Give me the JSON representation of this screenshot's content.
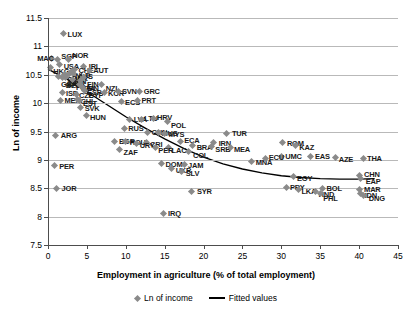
{
  "chart_data": {
    "type": "scatter",
    "title": "",
    "xlabel": "Employment in agriculture (% of total employment)",
    "ylabel": "Ln of income",
    "xlim": [
      0,
      45
    ],
    "ylim": [
      7.5,
      11.5
    ],
    "xticks": [
      0,
      5,
      10,
      15,
      20,
      25,
      30,
      35,
      40,
      45
    ],
    "yticks": [
      7.5,
      8,
      8.5,
      9,
      9.5,
      10,
      10.5,
      11,
      11.5
    ],
    "grid": true,
    "legend_position": "bottom",
    "legend": [
      {
        "label": "Ln of income",
        "marker": "diamond",
        "color": "#8a8a8a"
      },
      {
        "label": "Fitted values",
        "marker": "line",
        "color": "#000000"
      }
    ],
    "series": [
      {
        "name": "Ln of income",
        "points": [
          {
            "label": "LUX",
            "x": 2.0,
            "y": 11.22,
            "lx": 4,
            "ly": 0
          },
          {
            "label": "MAC",
            "x": 0.4,
            "y": 10.78,
            "lx": -14,
            "ly": -1
          },
          {
            "label": "SGP",
            "x": 1.2,
            "y": 10.76,
            "lx": 4,
            "ly": -4
          },
          {
            "label": "NOR",
            "x": 2.6,
            "y": 10.77,
            "lx": 4,
            "ly": -4
          },
          {
            "label": "USA",
            "x": 1.5,
            "y": 10.68,
            "lx": 4,
            "ly": 1
          },
          {
            "label": "HKG",
            "x": 0.3,
            "y": 10.62,
            "lx": 3,
            "ly": 3
          },
          {
            "label": "IRL",
            "x": 4.6,
            "y": 10.65,
            "lx": 5,
            "ly": 0
          },
          {
            "label": "CHE",
            "x": 3.4,
            "y": 10.6,
            "lx": 4,
            "ly": 1
          },
          {
            "label": "AUT",
            "x": 5.3,
            "y": 10.57,
            "lx": 4,
            "ly": -1
          },
          {
            "label": "NLD",
            "x": 3.0,
            "y": 10.55,
            "lx": 4,
            "ly": 3
          },
          {
            "label": "AUS",
            "x": 3.3,
            "y": 10.53,
            "lx": 4,
            "ly": 3
          },
          {
            "label": "DNK",
            "x": 2.7,
            "y": 10.52,
            "lx": 3,
            "ly": 4
          },
          {
            "label": "SWE",
            "x": 2.1,
            "y": 10.5,
            "lx": 3,
            "ly": 4
          },
          {
            "label": "CAN",
            "x": 2.4,
            "y": 10.48,
            "lx": 4,
            "ly": 5
          },
          {
            "label": "DEU",
            "x": 2.2,
            "y": 10.46,
            "lx": 4,
            "ly": 6
          },
          {
            "label": "BEL",
            "x": 1.9,
            "y": 10.45,
            "lx": 3,
            "ly": 7
          },
          {
            "label": "GBR",
            "x": 1.3,
            "y": 10.47,
            "lx": 3,
            "ly": 8
          },
          {
            "label": "FIN",
            "x": 4.5,
            "y": 10.45,
            "lx": 4,
            "ly": 6
          },
          {
            "label": "FRA",
            "x": 3.1,
            "y": 10.42,
            "lx": 4,
            "ly": 8
          },
          {
            "label": "JPN",
            "x": 4.2,
            "y": 10.4,
            "lx": 4,
            "ly": 8
          },
          {
            "label": "ITA",
            "x": 4.0,
            "y": 10.33,
            "lx": 5,
            "ly": 4
          },
          {
            "label": "ESP",
            "x": 4.4,
            "y": 10.28,
            "lx": 5,
            "ly": 5
          },
          {
            "label": "NZL",
            "x": 6.9,
            "y": 10.32,
            "lx": 4,
            "ly": 3
          },
          {
            "label": "CYP",
            "x": 4.7,
            "y": 10.22,
            "lx": 4,
            "ly": 4
          },
          {
            "label": "ISR",
            "x": 1.8,
            "y": 10.18,
            "lx": 4,
            "ly": 0
          },
          {
            "label": "CZE",
            "x": 3.6,
            "y": 10.16,
            "lx": 3,
            "ly": 1
          },
          {
            "label": "KOR",
            "x": 7.2,
            "y": 10.18,
            "lx": 4,
            "ly": 0
          },
          {
            "label": "SVN",
            "x": 9.0,
            "y": 10.2,
            "lx": 4,
            "ly": -1
          },
          {
            "label": "GRC",
            "x": 11.8,
            "y": 10.2,
            "lx": 4,
            "ly": -1
          },
          {
            "label": "MEX",
            "x": 1.6,
            "y": 10.05,
            "lx": 4,
            "ly": 0
          },
          {
            "label": "CHL",
            "x": 3.8,
            "y": 10.06,
            "lx": 3,
            "ly": 1
          },
          {
            "label": "EST",
            "x": 4.1,
            "y": 10.04,
            "lx": 3,
            "ly": 2
          },
          {
            "label": "ECS",
            "x": 9.4,
            "y": 10.02,
            "lx": 4,
            "ly": 0
          },
          {
            "label": "PRT",
            "x": 11.5,
            "y": 10.04,
            "lx": 4,
            "ly": -1
          },
          {
            "label": "SVK",
            "x": 4.2,
            "y": 9.93,
            "lx": 4,
            "ly": 1
          },
          {
            "label": "HUN",
            "x": 4.9,
            "y": 9.78,
            "lx": 4,
            "ly": 1
          },
          {
            "label": "LVA",
            "x": 10.5,
            "y": 9.72,
            "lx": 4,
            "ly": 0
          },
          {
            "label": "LTU",
            "x": 12.0,
            "y": 9.72,
            "lx": 3,
            "ly": -1
          },
          {
            "label": "HRV",
            "x": 13.5,
            "y": 9.73,
            "lx": 4,
            "ly": -1
          },
          {
            "label": "POL",
            "x": 15.3,
            "y": 9.67,
            "lx": 4,
            "ly": 3
          },
          {
            "label": "ARG",
            "x": 1.0,
            "y": 9.43,
            "lx": 5,
            "ly": 0
          },
          {
            "label": "RUS",
            "x": 9.8,
            "y": 9.56,
            "lx": 4,
            "ly": 0
          },
          {
            "label": "CHN",
            "x": 12.8,
            "y": 9.49,
            "lx": 4,
            "ly": 0
          },
          {
            "label": "MUS",
            "x": 14.2,
            "y": 9.48,
            "lx": 3,
            "ly": 0
          },
          {
            "label": "MYS",
            "x": 15.0,
            "y": 9.47,
            "lx": 4,
            "ly": 1
          },
          {
            "label": "TUR",
            "x": 23.0,
            "y": 9.47,
            "lx": 5,
            "ly": 0
          },
          {
            "label": "BGR",
            "x": 8.6,
            "y": 9.33,
            "lx": 4,
            "ly": 0
          },
          {
            "label": "ROU",
            "x": 10.0,
            "y": 9.32,
            "lx": 4,
            "ly": 0
          },
          {
            "label": "CRI",
            "x": 12.6,
            "y": 9.3,
            "lx": 4,
            "ly": 1
          },
          {
            "label": "URY",
            "x": 11.4,
            "y": 9.29,
            "lx": 3,
            "ly": 2
          },
          {
            "label": "ECA",
            "x": 17.0,
            "y": 9.33,
            "lx": 4,
            "ly": -1
          },
          {
            "label": "IRN",
            "x": 21.3,
            "y": 9.3,
            "lx": 5,
            "ly": 0
          },
          {
            "label": "BRA",
            "x": 18.6,
            "y": 9.26,
            "lx": 4,
            "ly": 2
          },
          {
            "label": "SRB",
            "x": 21.0,
            "y": 9.23,
            "lx": 4,
            "ly": 2
          },
          {
            "label": "MEA",
            "x": 23.4,
            "y": 9.22,
            "lx": 4,
            "ly": 2
          },
          {
            "label": "LAC",
            "x": 15.5,
            "y": 9.21,
            "lx": 3,
            "ly": 2
          },
          {
            "label": "PER",
            "x": 13.8,
            "y": 9.22,
            "lx": 3,
            "ly": 3
          },
          {
            "label": "COL",
            "x": 18.0,
            "y": 9.14,
            "lx": 5,
            "ly": 3
          },
          {
            "label": "ZAF",
            "x": 9.2,
            "y": 9.18,
            "lx": 4,
            "ly": 2
          },
          {
            "label": "ROM",
            "x": 30.2,
            "y": 9.3,
            "lx": 4,
            "ly": 0
          },
          {
            "label": "KAZ",
            "x": 31.8,
            "y": 9.26,
            "lx": 4,
            "ly": 2
          },
          {
            "label": "UMC",
            "x": 30.0,
            "y": 9.06,
            "lx": 4,
            "ly": 0
          },
          {
            "label": "EAS",
            "x": 33.8,
            "y": 9.06,
            "lx": 4,
            "ly": 0
          },
          {
            "label": "AZE",
            "x": 37.0,
            "y": 9.04,
            "lx": 3,
            "ly": 1
          },
          {
            "label": "THA",
            "x": 40.5,
            "y": 9.03,
            "lx": 4,
            "ly": 0
          },
          {
            "label": "MNA",
            "x": 26.2,
            "y": 8.98,
            "lx": 4,
            "ly": 1
          },
          {
            "label": "ECU",
            "x": 28.0,
            "y": 9.02,
            "lx": 3,
            "ly": -2
          },
          {
            "label": "PER",
            "x": 0.8,
            "y": 8.9,
            "lx": 5,
            "ly": 0
          },
          {
            "label": "DOM",
            "x": 14.6,
            "y": 8.93,
            "lx": 4,
            "ly": 0
          },
          {
            "label": "JAM",
            "x": 17.5,
            "y": 8.92,
            "lx": 4,
            "ly": 1
          },
          {
            "label": "UKR",
            "x": 15.9,
            "y": 8.84,
            "lx": 4,
            "ly": 1
          },
          {
            "label": "SLV",
            "x": 17.2,
            "y": 8.8,
            "lx": 4,
            "ly": 2
          },
          {
            "label": "EGY",
            "x": 31.5,
            "y": 8.7,
            "lx": 4,
            "ly": 1
          },
          {
            "label": "CHN",
            "x": 40.0,
            "y": 8.72,
            "lx": 5,
            "ly": -2
          },
          {
            "label": "EAP",
            "x": 40.2,
            "y": 8.67,
            "lx": 5,
            "ly": 2
          },
          {
            "label": "JOR",
            "x": 1.1,
            "y": 8.5,
            "lx": 5,
            "ly": 0
          },
          {
            "label": "SYR",
            "x": 18.5,
            "y": 8.45,
            "lx": 5,
            "ly": 0
          },
          {
            "label": "PRY",
            "x": 30.6,
            "y": 8.52,
            "lx": 4,
            "ly": 0
          },
          {
            "label": "LKA",
            "x": 32.2,
            "y": 8.48,
            "lx": 3,
            "ly": 2
          },
          {
            "label": "BOL",
            "x": 35.3,
            "y": 8.5,
            "lx": 4,
            "ly": 0
          },
          {
            "label": "HND",
            "x": 34.4,
            "y": 8.44,
            "lx": 3,
            "ly": 2
          },
          {
            "label": "PHL",
            "x": 35.0,
            "y": 8.4,
            "lx": 3,
            "ly": 4
          },
          {
            "label": "MAR",
            "x": 40.0,
            "y": 8.48,
            "lx": 5,
            "ly": 0
          },
          {
            "label": "IDN",
            "x": 40.2,
            "y": 8.41,
            "lx": 4,
            "ly": 2
          },
          {
            "label": "DNG",
            "x": 40.6,
            "y": 8.38,
            "lx": 5,
            "ly": 3
          },
          {
            "label": "IRQ",
            "x": 14.8,
            "y": 8.06,
            "lx": 5,
            "ly": 0
          }
        ]
      }
    ],
    "fitted_curve": {
      "name": "Fitted values",
      "color": "#000000",
      "points": [
        {
          "x": 0.0,
          "y": 10.6
        },
        {
          "x": 2.5,
          "y": 10.42
        },
        {
          "x": 5.0,
          "y": 10.2
        },
        {
          "x": 7.5,
          "y": 9.98
        },
        {
          "x": 10.0,
          "y": 9.76
        },
        {
          "x": 12.5,
          "y": 9.56
        },
        {
          "x": 15.0,
          "y": 9.37
        },
        {
          "x": 17.5,
          "y": 9.2
        },
        {
          "x": 20.0,
          "y": 9.05
        },
        {
          "x": 22.5,
          "y": 8.93
        },
        {
          "x": 25.0,
          "y": 8.84
        },
        {
          "x": 27.5,
          "y": 8.77
        },
        {
          "x": 30.0,
          "y": 8.72
        },
        {
          "x": 32.5,
          "y": 8.69
        },
        {
          "x": 35.0,
          "y": 8.67
        },
        {
          "x": 37.5,
          "y": 8.66
        },
        {
          "x": 40.0,
          "y": 8.66
        },
        {
          "x": 42.0,
          "y": 8.67
        }
      ]
    }
  }
}
